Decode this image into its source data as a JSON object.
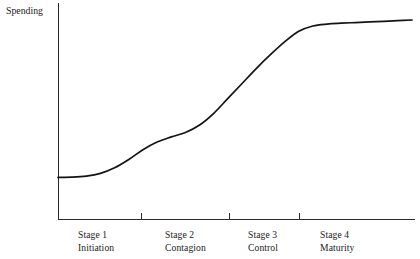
{
  "figure": {
    "y_axis_label": "Spending",
    "x_axis_label": "",
    "title": ""
  },
  "stages": [
    {
      "name": "Stage 1",
      "subtitle": "Initiation"
    },
    {
      "name": "Stage 2",
      "subtitle": "Contagion"
    },
    {
      "name": "Stage 3",
      "subtitle": "Control"
    },
    {
      "name": "Stage 4",
      "subtitle": "Maturity"
    }
  ],
  "colors": {
    "curve": "#141414",
    "axis": "#2b2b2b",
    "background": "#ffffff",
    "text": "#1a1a1a"
  },
  "chart_data": {
    "type": "line",
    "title": "",
    "xlabel": "",
    "ylabel": "Spending",
    "grid": false,
    "legend": "none",
    "axis_style": "open (left and bottom spines only, no numeric ticks)",
    "xlim": [
      0,
      100
    ],
    "ylim": [
      0,
      100
    ],
    "x_tick_values": [
      23.5,
      48.4,
      68.0
    ],
    "x_tick_labels": [
      "",
      "",
      ""
    ],
    "y_tick_values": [],
    "y_tick_labels": [],
    "stage_boundaries": [
      23.5,
      48.4,
      68.0
    ],
    "category_labels": [
      "Stage 1\nInitiation",
      "Stage 2\nContagion",
      "Stage 3\nControl",
      "Stage 4\nMaturity"
    ],
    "series": [
      {
        "name": "Spending",
        "description": "Double-S growth curve: flat in Stage 1, rising through Stage 2 with a shoulder, steep growth in Stage 3, plateau in Stage 4",
        "x": [
          0,
          4,
          8,
          12,
          16,
          20,
          24,
          28,
          32,
          36,
          40,
          44,
          48,
          52,
          56,
          60,
          64,
          68,
          72,
          76,
          80,
          84,
          88,
          92,
          96,
          100
        ],
        "y": [
          19.4,
          19.5,
          20.0,
          21.3,
          23.9,
          27.8,
          32.4,
          36.0,
          38.4,
          40.5,
          44.0,
          49.5,
          56.5,
          63.5,
          70.5,
          77.0,
          83.0,
          88.0,
          90.5,
          91.4,
          91.8,
          92.1,
          92.4,
          92.7,
          93.0,
          93.3
        ]
      }
    ],
    "annotations": []
  }
}
